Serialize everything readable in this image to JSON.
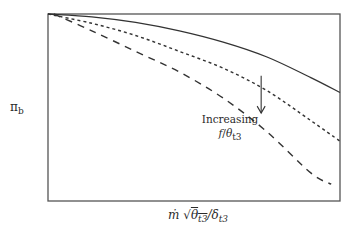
{
  "chart_data": {
    "type": "line",
    "title": "",
    "xlabel": "ṁ √θt3 / δt3",
    "ylabel": "πb",
    "xlabel_parts": {
      "mdot": "ṁ",
      "sqrt": "√",
      "theta": "θ",
      "theta_sub": "t3",
      "slash": "/",
      "delta": "δ",
      "delta_sub": "t3"
    },
    "ylabel_parts": {
      "pi": "π",
      "sub": "b"
    },
    "xlim": [
      0,
      1
    ],
    "ylim": [
      0,
      1
    ],
    "ticks": "none",
    "grid": false,
    "legend": "none",
    "annotation": {
      "line1": "Increasing",
      "f": "f",
      "slash": "/",
      "theta": "θ",
      "sub": "t3",
      "arrow_direction": "down",
      "arrow_from": [
        0.73,
        0.67
      ],
      "arrow_to": [
        0.73,
        0.47
      ]
    },
    "series": [
      {
        "name": "low f/theta_t3",
        "style": "solid",
        "x": [
          0.0,
          0.15,
          0.3,
          0.45,
          0.6,
          0.75,
          0.9,
          1.0
        ],
        "y": [
          1.0,
          0.985,
          0.955,
          0.91,
          0.85,
          0.77,
          0.66,
          0.58
        ]
      },
      {
        "name": "medium f/theta_t3",
        "style": "dotted",
        "x": [
          0.0,
          0.15,
          0.3,
          0.45,
          0.6,
          0.75,
          0.9,
          1.0
        ],
        "y": [
          1.0,
          0.95,
          0.885,
          0.8,
          0.71,
          0.59,
          0.43,
          0.32
        ]
      },
      {
        "name": "high f/theta_t3",
        "style": "dashed",
        "x": [
          0.02,
          0.15,
          0.3,
          0.45,
          0.6,
          0.75,
          0.9,
          0.97
        ],
        "y": [
          1.0,
          0.91,
          0.8,
          0.69,
          0.55,
          0.37,
          0.15,
          0.09
        ]
      }
    ]
  }
}
